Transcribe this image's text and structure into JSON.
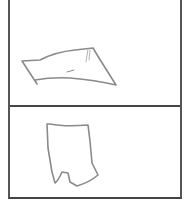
{
  "panels": [
    {
      "name": "top-panel",
      "sketch": "flat-quadrilateral"
    },
    {
      "name": "bottom-panel",
      "sketch": "shorts-outline"
    }
  ],
  "colors": {
    "border": "#555555",
    "stroke": "#8a8a8a"
  }
}
